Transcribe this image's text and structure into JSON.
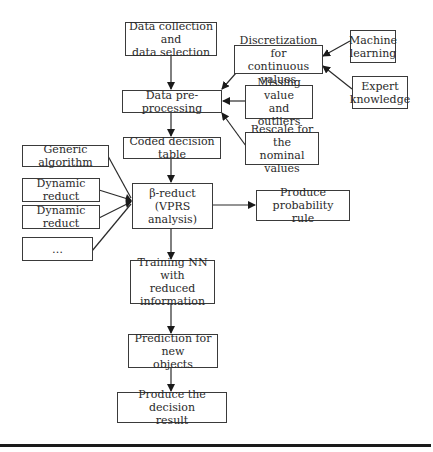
{
  "diagram": {
    "type": "flowchart",
    "nodes": {
      "data_collection": "Data collection and\ndata selection",
      "discretization": "Discretization for\ncontinuous values",
      "machine_learning": "Machine\nlearning",
      "expert_knowledge": "Expert\nknowledge",
      "data_preprocessing": "Data pre-processing",
      "missing_value": "Missing value\nand outliers",
      "rescale": "Rescale for the\nnominal values",
      "coded_table": "Coded decision table",
      "generic_algorithm": "Generic algorithm",
      "dynamic_reduct_1": "Dynamic reduct",
      "dynamic_reduct_2": "Dynamic reduct",
      "ellipsis": "…",
      "beta_reduct": "β-reduct\n(VPRS analysis)",
      "probability_rule": "Produce probability\nrule",
      "training_nn": "Training NN with\nreduced\ninformation",
      "prediction": "Prediction for new\nobjects",
      "decision_result": "Produce the decision\nresult"
    },
    "edges": [
      {
        "from": "data_collection",
        "to": "data_preprocessing"
      },
      {
        "from": "machine_learning",
        "to": "discretization"
      },
      {
        "from": "expert_knowledge",
        "to": "discretization"
      },
      {
        "from": "discretization",
        "to": "data_preprocessing"
      },
      {
        "from": "missing_value",
        "to": "data_preprocessing"
      },
      {
        "from": "rescale",
        "to": "data_preprocessing"
      },
      {
        "from": "data_preprocessing",
        "to": "coded_table"
      },
      {
        "from": "coded_table",
        "to": "beta_reduct"
      },
      {
        "from": "generic_algorithm",
        "to": "beta_reduct"
      },
      {
        "from": "dynamic_reduct_1",
        "to": "beta_reduct"
      },
      {
        "from": "dynamic_reduct_2",
        "to": "beta_reduct"
      },
      {
        "from": "ellipsis",
        "to": "beta_reduct"
      },
      {
        "from": "beta_reduct",
        "to": "probability_rule"
      },
      {
        "from": "beta_reduct",
        "to": "training_nn"
      },
      {
        "from": "training_nn",
        "to": "prediction"
      },
      {
        "from": "prediction",
        "to": "decision_result"
      }
    ],
    "colors": {
      "stroke": "#3a3a3a",
      "text": "#2a2a2a",
      "background": "#ffffff",
      "rule": "#1a1a1a"
    }
  }
}
